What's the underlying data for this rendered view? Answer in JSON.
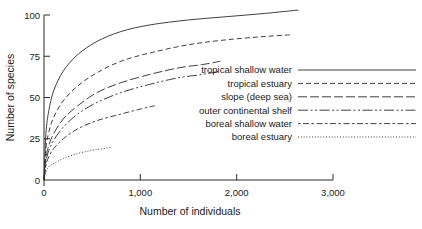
{
  "chart_data": {
    "type": "line",
    "title": "",
    "xlabel": "Number of individuals",
    "ylabel": "Number of species",
    "xlim": [
      0,
      3100
    ],
    "ylim": [
      0,
      104
    ],
    "xticks": [
      0,
      1000,
      2000,
      3000
    ],
    "xtick_labels": [
      "0",
      "1,000",
      "2,000",
      "3,000"
    ],
    "yticks": [
      0,
      25,
      50,
      75,
      100
    ],
    "ytick_labels": [
      "0",
      "25",
      "50",
      "75",
      "100"
    ],
    "grid": false,
    "legend_position": "right-inside",
    "series": [
      {
        "name": "tropical shallow water",
        "style": "solid",
        "points": [
          [
            0,
            0
          ],
          [
            20,
            28
          ],
          [
            50,
            42
          ],
          [
            100,
            54
          ],
          [
            200,
            66
          ],
          [
            350,
            76
          ],
          [
            550,
            84
          ],
          [
            800,
            90
          ],
          [
            1100,
            94
          ],
          [
            1500,
            97
          ],
          [
            1900,
            99
          ],
          [
            2300,
            101
          ],
          [
            2640,
            103
          ]
        ]
      },
      {
        "name": "tropical estuary",
        "style": "dashed",
        "points": [
          [
            0,
            0
          ],
          [
            20,
            19
          ],
          [
            50,
            29
          ],
          [
            100,
            38
          ],
          [
            200,
            48
          ],
          [
            350,
            57
          ],
          [
            550,
            65
          ],
          [
            800,
            72
          ],
          [
            1100,
            77
          ],
          [
            1500,
            82
          ],
          [
            1900,
            85
          ],
          [
            2300,
            87
          ],
          [
            2560,
            88
          ]
        ]
      },
      {
        "name": "slope (deep sea)",
        "style": "longdashdot",
        "points": [
          [
            0,
            0
          ],
          [
            20,
            13
          ],
          [
            50,
            21
          ],
          [
            100,
            28
          ],
          [
            200,
            37
          ],
          [
            350,
            45
          ],
          [
            550,
            53
          ],
          [
            800,
            59
          ],
          [
            1100,
            64
          ],
          [
            1400,
            68
          ],
          [
            1650,
            70
          ],
          [
            1830,
            72
          ]
        ]
      },
      {
        "name": "outer continental shelf",
        "style": "dashdotdot",
        "points": [
          [
            0,
            0
          ],
          [
            20,
            11
          ],
          [
            50,
            18
          ],
          [
            100,
            24
          ],
          [
            200,
            32
          ],
          [
            350,
            40
          ],
          [
            550,
            47
          ],
          [
            800,
            53
          ],
          [
            1100,
            58
          ],
          [
            1400,
            62
          ],
          [
            1650,
            64
          ],
          [
            1830,
            66
          ]
        ]
      },
      {
        "name": "boreal shallow water",
        "style": "dashdash",
        "points": [
          [
            0,
            0
          ],
          [
            20,
            9
          ],
          [
            50,
            14
          ],
          [
            100,
            19
          ],
          [
            200,
            25
          ],
          [
            350,
            31
          ],
          [
            550,
            36
          ],
          [
            800,
            40
          ],
          [
            1000,
            43
          ],
          [
            1150,
            45
          ]
        ]
      },
      {
        "name": "boreal estuary",
        "style": "dotted",
        "points": [
          [
            0,
            0
          ],
          [
            20,
            5
          ],
          [
            50,
            8
          ],
          [
            100,
            10
          ],
          [
            200,
            13
          ],
          [
            350,
            16
          ],
          [
            500,
            18
          ],
          [
            620,
            19
          ],
          [
            700,
            20
          ]
        ]
      }
    ],
    "legend_entries": [
      {
        "label": "tropical shallow water",
        "style": "solid"
      },
      {
        "label": "tropical estuary",
        "style": "dashed"
      },
      {
        "label": "slope (deep sea)",
        "style": "longdashdot"
      },
      {
        "label": "outer continental shelf",
        "style": "dashdotdot"
      },
      {
        "label": "boreal shallow water",
        "style": "dashdash"
      },
      {
        "label": "boreal estuary",
        "style": "dotted"
      }
    ]
  }
}
